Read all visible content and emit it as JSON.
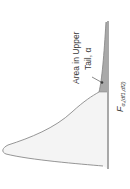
{
  "diagram": {
    "type": "f-distribution-density",
    "orientation": "rotated-90-ccw",
    "annotation": {
      "line1": "Area in Upper",
      "line2": "Tail, α"
    },
    "critical_value_label": {
      "main": "F",
      "subscript": "α,(df1,df2)"
    },
    "colors": {
      "curve": "#8a8a8a",
      "body_fill": "#f4f4f4",
      "tail_fill": "#a9a9a9",
      "baseline": "#7a7a7a",
      "text": "#3a3a3a"
    }
  }
}
